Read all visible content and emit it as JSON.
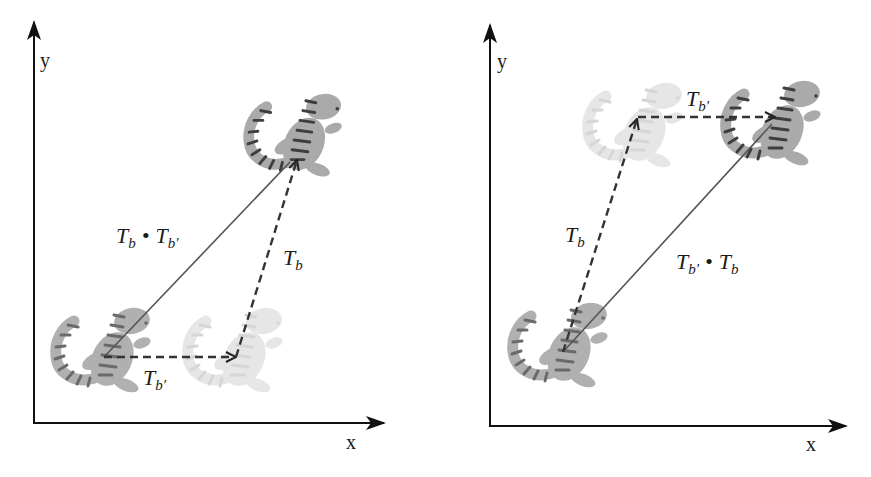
{
  "colors": {
    "axis": "#111111",
    "solid_path": "#555555",
    "dashed_path": "#333333",
    "lizard_body": "#a9a9a9",
    "lizard_stripe": "#555555",
    "ghost_body": "#e4e4e4",
    "ghost_stripe": "#d2d2d2"
  },
  "panels": [
    {
      "id": "left",
      "axes": {
        "x_label": "x",
        "y_label": "y"
      },
      "labels": {
        "composite": {
          "base": "T",
          "sub1": "b",
          "dot": "•",
          "base2": "T",
          "sub2": "b′"
        },
        "vertical_step": {
          "base": "T",
          "sub": "b"
        },
        "horizontal_step": {
          "base": "T",
          "sub": "b′"
        }
      },
      "description": "First translate by T_b' (horizontal), then T_b (up-right); composite T_b • T_b'"
    },
    {
      "id": "right",
      "axes": {
        "x_label": "x",
        "y_label": "y"
      },
      "labels": {
        "composite": {
          "base": "T",
          "sub1": "b′",
          "dot": "•",
          "base2": "T",
          "sub2": "b"
        },
        "vertical_step": {
          "base": "T",
          "sub": "b"
        },
        "horizontal_step": {
          "base": "T",
          "sub": "b′"
        }
      },
      "description": "First translate by T_b (up-right), then T_b' (horizontal); composite T_b' • T_b"
    }
  ]
}
